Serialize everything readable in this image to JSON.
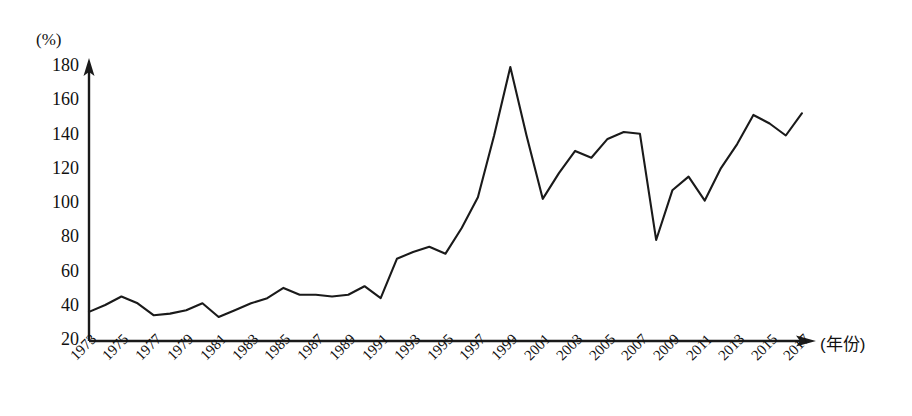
{
  "chart_data": {
    "type": "line",
    "title": "",
    "subtitle": "",
    "xlabel": "(年份)",
    "ylabel": "(%)",
    "y_unit_label": "(%)",
    "x_axis_title": "(年份)",
    "grid": false,
    "legend": "none",
    "xlim": [
      1973,
      2017
    ],
    "ylim": [
      20,
      180
    ],
    "y_ticks": [
      180,
      160,
      140,
      120,
      100,
      80,
      60,
      40,
      20
    ],
    "y_tick_labels": [
      "180",
      "160",
      "140",
      "120",
      "100",
      "80",
      "60",
      "40",
      "20"
    ],
    "x_ticks": [
      1973,
      1975,
      1977,
      1979,
      1981,
      1983,
      1985,
      1987,
      1989,
      1991,
      1993,
      1995,
      1997,
      1999,
      2001,
      2003,
      2005,
      2007,
      2009,
      2011,
      2013,
      2015,
      2017
    ],
    "x_tick_labels": [
      "1973",
      "1975",
      "1977",
      "1979",
      "1981",
      "1983",
      "1985",
      "1987",
      "1989",
      "1991",
      "1993",
      "1995",
      "1997",
      "1999",
      "2001",
      "2003",
      "2005",
      "2007",
      "2009",
      "2011",
      "2013",
      "2015",
      "2017"
    ],
    "x": [
      1973,
      1974,
      1975,
      1976,
      1977,
      1978,
      1979,
      1980,
      1981,
      1982,
      1983,
      1984,
      1985,
      1986,
      1987,
      1988,
      1989,
      1990,
      1991,
      1992,
      1993,
      1994,
      1995,
      1996,
      1997,
      1998,
      1999,
      2000,
      2001,
      2002,
      2003,
      2004,
      2005,
      2006,
      2007,
      2008,
      2009,
      2010,
      2011,
      2012,
      2013,
      2014,
      2015,
      2016,
      2017
    ],
    "series": [
      {
        "name": "比率",
        "color": "#1a1a1a",
        "values": [
          37,
          41,
          46,
          42,
          35,
          36,
          38,
          42,
          34,
          38,
          42,
          45,
          51,
          47,
          47,
          46,
          47,
          52,
          45,
          68,
          72,
          75,
          71,
          86,
          104,
          140,
          180,
          140,
          103,
          118,
          131,
          127,
          138,
          142,
          141,
          79,
          108,
          116,
          102,
          121,
          135,
          152,
          147,
          140,
          153
        ]
      }
    ],
    "axis_style": {
      "arrow_heads": true,
      "axis_color": "#1a1a1a",
      "line_width": 2
    }
  }
}
